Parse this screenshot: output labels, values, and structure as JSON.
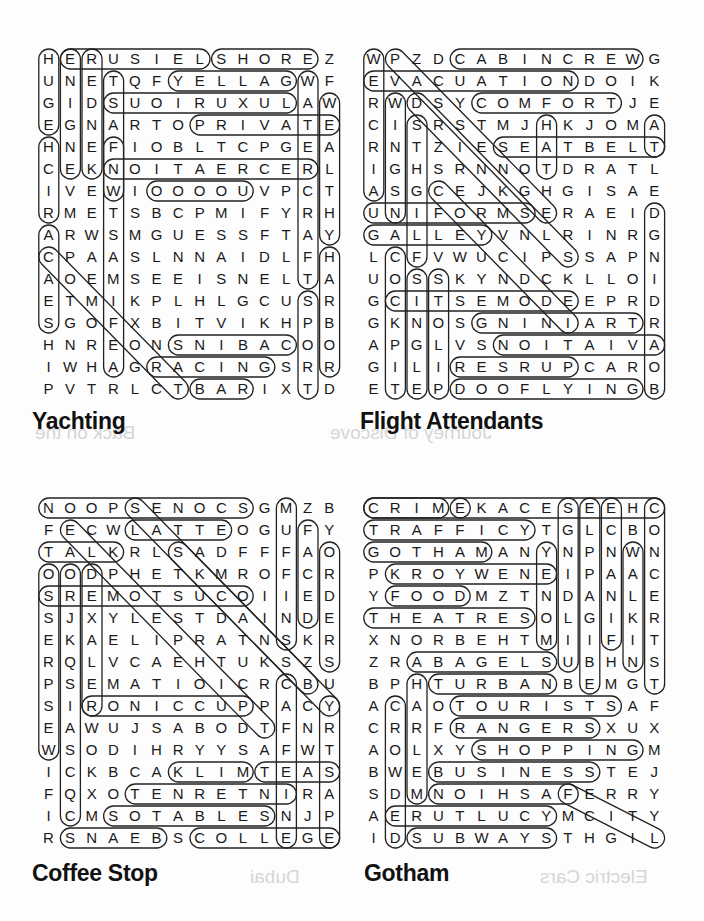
{
  "ghost_text": [
    "Back on the",
    "Journey of Discove",
    "Electric Cars",
    "Dubai"
  ],
  "puzzles": [
    {
      "title": "Yachting",
      "origin": [
        38,
        48
      ],
      "title_pos": [
        32,
        415
      ],
      "rows": [
        "HERUSIELSHOREZ",
        "UNETQFYELLAGWF",
        "GIDSUOIRUXULAW",
        "EGNARTOPRIVATE",
        "HNEFIOBLTCPGEA",
        "CEKNOITAERCERL",
        "IVEWIOOOOUVPCT",
        "RMETSBCPMIFYRH",
        "ARWSMGUESSFTAY",
        "CPAASLNNAIDLFH",
        "AOEMSEEISNELTA",
        "ETMIKPLHLGCUSR",
        "SGOFXBITVIKHPB",
        "HNREONSNIBACOO",
        "IWHAGRACINGSRR",
        "PVTRLCTBARIXTD"
      ],
      "loops": [
        [
          0,
          0,
          3,
          0
        ],
        [
          0,
          1,
          0,
          7
        ],
        [
          0,
          8,
          0,
          12
        ],
        [
          1,
          6,
          1,
          11
        ],
        [
          2,
          3,
          2,
          11
        ],
        [
          3,
          7,
          3,
          13
        ],
        [
          5,
          3,
          5,
          12
        ],
        [
          4,
          0,
          7,
          0
        ],
        [
          0,
          1,
          5,
          1
        ],
        [
          0,
          2,
          5,
          2
        ],
        [
          1,
          12,
          10,
          12
        ],
        [
          2,
          13,
          8,
          13
        ],
        [
          9,
          13,
          14,
          13
        ],
        [
          13,
          6,
          13,
          11
        ],
        [
          14,
          5,
          14,
          10
        ],
        [
          15,
          7,
          15,
          9
        ],
        [
          11,
          12,
          15,
          12
        ],
        [
          8,
          0,
          12,
          0
        ],
        [
          9,
          0,
          15,
          6
        ],
        [
          4,
          3,
          14,
          3
        ],
        [
          6,
          5,
          6,
          9
        ],
        [
          1,
          3,
          6,
          3
        ]
      ]
    },
    {
      "title": "Flight Attendants",
      "origin": [
        363,
        48
      ],
      "title_pos": [
        360,
        415
      ],
      "rows": [
        "WPZDCABINCREWG",
        "EVACUATIONDOIK",
        "RWDSYCOMFORTJE",
        "CISRSTMJHKJOMA",
        "RNTZIESEATBELT",
        "IGHSRNNOTDRATL",
        "ASGCEJKGHGISAE",
        "UNIFORMSERAEID",
        "GALLEYVNLRINRG",
        "LCFVWUCIPSSAPN",
        "UOSSKYNDCKLLOI",
        "GCITSEMODEEPRD",
        "GKNOSGNINIARTR",
        "APGLVSNOITAIVA",
        "GILIRESRUPCARO",
        "ETEPDOOFLYINGB"
      ],
      "loops": [
        [
          0,
          4,
          0,
          12
        ],
        [
          1,
          0,
          1,
          9
        ],
        [
          2,
          5,
          2,
          11
        ],
        [
          4,
          6,
          4,
          13
        ],
        [
          7,
          0,
          7,
          7
        ],
        [
          8,
          0,
          8,
          5
        ],
        [
          12,
          5,
          12,
          12
        ],
        [
          13,
          6,
          13,
          13
        ],
        [
          14,
          4,
          14,
          9
        ],
        [
          15,
          4,
          15,
          12
        ],
        [
          0,
          0,
          6,
          0
        ],
        [
          2,
          1,
          7,
          1
        ],
        [
          3,
          2,
          9,
          2
        ],
        [
          9,
          1,
          15,
          1
        ],
        [
          10,
          2,
          15,
          2
        ],
        [
          10,
          3,
          15,
          3
        ],
        [
          11,
          1,
          11,
          9
        ],
        [
          7,
          13,
          15,
          13
        ],
        [
          3,
          13,
          4,
          13
        ],
        [
          3,
          8,
          5,
          8
        ],
        [
          0,
          1,
          7,
          8
        ],
        [
          2,
          2,
          9,
          9
        ],
        [
          6,
          3,
          12,
          9
        ]
      ]
    },
    {
      "title": "Coffee Stop",
      "origin": [
        38,
        497
      ],
      "title_pos": [
        32,
        860
      ],
      "rows": [
        "NOOPSENOCSGMZB",
        "FECWLATTEOGUFY",
        "TALKRLSADFFFAO",
        "OODPHETKMROFCR",
        "SREMOTSUCOIIED",
        "SJXYLESTDAINDE",
        "EKAELIPRATNSKR",
        "RQLVCAEHTUKSZS",
        "PSEMATIOICRCBU",
        "SIRONICCUPPACY",
        "EAWUJSABODTFNR",
        "WSODIHRYYSAFWT",
        "ICKBCAKLIMTEAS",
        "FQXOTENRETNIRA",
        "ICMSOTABLESNJP",
        "RSNAEBSCOLLEGE"
      ],
      "loops": [
        [
          0,
          0,
          0,
          9
        ],
        [
          1,
          4,
          1,
          8
        ],
        [
          2,
          0,
          2,
          3
        ],
        [
          4,
          0,
          4,
          9
        ],
        [
          0,
          11,
          6,
          11
        ],
        [
          1,
          12,
          5,
          12
        ],
        [
          2,
          13,
          7,
          13
        ],
        [
          3,
          0,
          11,
          0
        ],
        [
          3,
          1,
          14,
          1
        ],
        [
          3,
          2,
          9,
          2
        ],
        [
          9,
          2,
          9,
          9
        ],
        [
          12,
          6,
          12,
          9
        ],
        [
          12,
          10,
          12,
          13
        ],
        [
          13,
          4,
          13,
          11
        ],
        [
          14,
          3,
          14,
          10
        ],
        [
          15,
          1,
          15,
          5
        ],
        [
          15,
          7,
          15,
          13
        ],
        [
          9,
          13,
          15,
          13
        ],
        [
          8,
          11,
          15,
          11
        ],
        [
          1,
          1,
          10,
          10
        ],
        [
          0,
          4,
          8,
          12
        ],
        [
          2,
          6,
          9,
          13
        ]
      ]
    },
    {
      "title": "Gotham",
      "origin": [
        363,
        497
      ],
      "title_pos": [
        364,
        860
      ],
      "rows": [
        "CRIMEKACESEEHC",
        "TRAFFICYTGLCBO",
        "GOTHAMANYNPNWN",
        "PKROYWENEIPAAC",
        "YFOODMZTNDANLE",
        "THEATRESOLGIKR",
        "XNORBEHTMIIFIT",
        "ZRABAGELSUBHNS",
        "BPHTURBANBEMGT",
        "ACAOTOURISTSAF",
        "CRRFRANGERSXUX",
        "AOLXYSHOPPINGM",
        "BWEBUSINESSTEJ",
        "SDMNOIHSAFERRY",
        "AERUTLUCYMCITY",
        "IDSUBWAYSTHGIL"
      ],
      "loops": [
        [
          0,
          0,
          0,
          3
        ],
        [
          0,
          4,
          0,
          4
        ],
        [
          1,
          0,
          1,
          7
        ],
        [
          2,
          0,
          2,
          5
        ],
        [
          3,
          1,
          3,
          8
        ],
        [
          4,
          1,
          4,
          4
        ],
        [
          5,
          0,
          5,
          7
        ],
        [
          7,
          2,
          7,
          8
        ],
        [
          8,
          3,
          8,
          8
        ],
        [
          9,
          4,
          9,
          11
        ],
        [
          10,
          4,
          10,
          10
        ],
        [
          11,
          5,
          11,
          12
        ],
        [
          12,
          3,
          12,
          10
        ],
        [
          13,
          3,
          13,
          9
        ],
        [
          14,
          1,
          14,
          8
        ],
        [
          15,
          2,
          15,
          8
        ],
        [
          0,
          13,
          8,
          13
        ],
        [
          0,
          9,
          7,
          9
        ],
        [
          0,
          10,
          8,
          10
        ],
        [
          0,
          11,
          6,
          11
        ],
        [
          2,
          12,
          7,
          12
        ],
        [
          2,
          8,
          6,
          8
        ],
        [
          13,
          9,
          15,
          13
        ],
        [
          9,
          1,
          15,
          1
        ],
        [
          8,
          2,
          13,
          2
        ],
        [
          0,
          0,
          0,
          13
        ]
      ]
    }
  ]
}
